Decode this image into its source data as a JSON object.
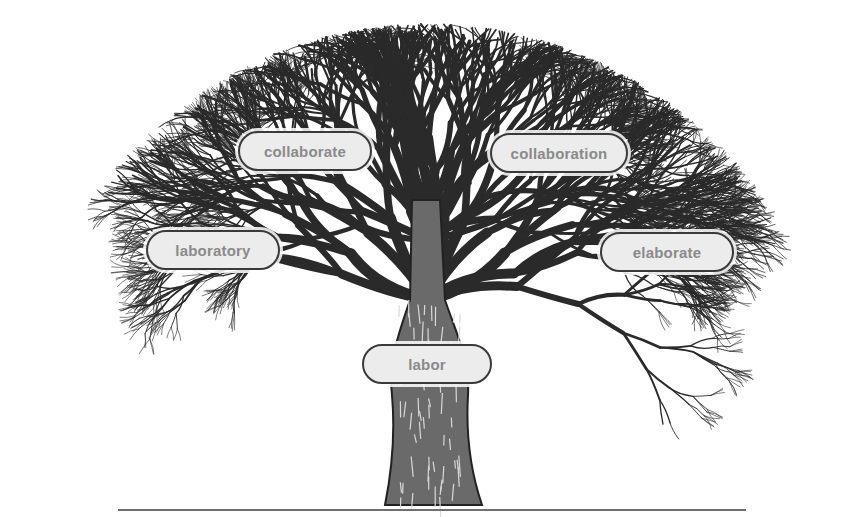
{
  "diagram": {
    "type": "word-family-tree",
    "root": {
      "label": "labor",
      "x": 427,
      "y": 364
    },
    "branches": [
      {
        "label": "collaborate",
        "x": 305,
        "y": 151
      },
      {
        "label": "collaboration",
        "x": 559,
        "y": 153
      },
      {
        "label": "laboratory",
        "x": 212,
        "y": 250
      },
      {
        "label": "elaborate",
        "x": 666,
        "y": 252
      }
    ],
    "colors": {
      "label_fill": "#ececec",
      "label_border": "#3a3a3a",
      "label_text": "#8a8a8a",
      "tree_ink": "#2a2a2a",
      "ground_line": "#707070"
    }
  }
}
